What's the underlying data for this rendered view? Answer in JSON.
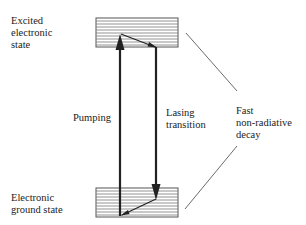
{
  "labels": {
    "excited_state": "Excited\nelectronic\nstate",
    "ground_state": "Electronic\nground state",
    "pumping": "Pumping",
    "lasing": "Lasing\ntransition",
    "decay": "Fast\nnon-radiative\ndecay"
  },
  "levels": {
    "excited": {
      "x": 96,
      "y": 18,
      "width": 82,
      "height": 29,
      "lines": 9
    },
    "ground": {
      "x": 96,
      "y": 188,
      "width": 82,
      "height": 29,
      "lines": 9
    }
  },
  "colors": {
    "line": "#222222",
    "band_line": "#555555"
  }
}
